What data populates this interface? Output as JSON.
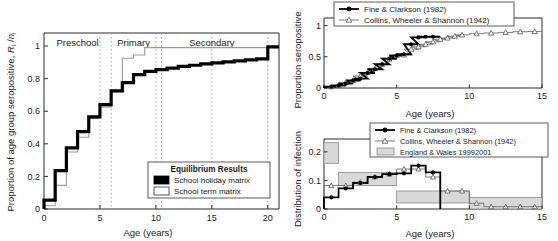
{
  "figure": {
    "panels": [
      "equilibrium-seroprofile",
      "seroprevalence-comparison",
      "infection-distribution"
    ]
  },
  "main_panel": {
    "xlabel": "Age (years)",
    "ylabel_prefix": "Proportion of age group seropositive, ",
    "ylabel_symbol": "R",
    "ylabel_sub1": "i",
    "ylabel_mid": " /",
    "ylabel_symbol2": "n",
    "ylabel_sub2": "i",
    "regions": [
      {
        "label": "Preschool",
        "x_center": 3.0
      },
      {
        "label": "Primary",
        "x_center": 8.0
      },
      {
        "label": "Secondary",
        "x_center": 15.0
      }
    ],
    "region_boundaries": [
      6,
      10.5
    ],
    "xticks": [
      "0",
      "5",
      "10",
      "15",
      "20"
    ],
    "yticks": [
      "0",
      "0.2",
      "0.4",
      "0.6",
      "0.8",
      "1"
    ],
    "legend": {
      "title": "Equilibrium Results",
      "items": [
        {
          "label": "School holiday matrix",
          "swatch": "black-filled-square"
        },
        {
          "label": "School term matrix",
          "swatch": "white-open-square"
        }
      ]
    }
  },
  "top_right_panel": {
    "xlabel": "Age (years)",
    "ylabel": "Proportion seropositive",
    "xticks": [
      "0",
      "5",
      "10",
      "15"
    ],
    "yticks": [
      "0",
      "0.5",
      "1"
    ],
    "legend": {
      "items": [
        {
          "label": "Fine & Clarkson (1982)",
          "marker": "filled-circle-line"
        },
        {
          "label": "Collins, Wheeler & Shannon (1942)",
          "marker": "open-triangle-line"
        }
      ]
    }
  },
  "bottom_right_panel": {
    "xlabel": "Age (years)",
    "ylabel": "Distribution of infection",
    "xticks": [
      "0",
      "5",
      "10",
      "15"
    ],
    "yticks": [
      "0",
      "0.1",
      "0.2"
    ],
    "legend": {
      "items": [
        {
          "label": "Fine & Clarkson (1982)",
          "marker": "filled-circle-line"
        },
        {
          "label": "Collins, Wheeler & Shannon (1942)",
          "marker": "open-triangle-line"
        },
        {
          "label": "England & Wales 19992001",
          "marker": "grey-box"
        }
      ]
    }
  },
  "chart_data": [
    {
      "type": "line",
      "id": "equilibrium-seroprofile",
      "title": "",
      "xlabel": "Age (years)",
      "ylabel": "Proportion of age group seropositive, Ri /ni",
      "xlim": [
        0,
        21
      ],
      "ylim": [
        0,
        1.08
      ],
      "grid": false,
      "legend_position": "lower-right",
      "x_edges": [
        0,
        1,
        2,
        3,
        4,
        5,
        6,
        7,
        8,
        9,
        10,
        11,
        12,
        13,
        14,
        15,
        16,
        17,
        18,
        19,
        20,
        21
      ],
      "series": [
        {
          "name": "School holiday matrix",
          "style": "thick-black-step",
          "values": [
            0.055,
            0.235,
            0.375,
            0.475,
            0.565,
            0.64,
            0.725,
            0.775,
            0.825,
            0.845,
            0.855,
            0.865,
            0.875,
            0.882,
            0.89,
            0.897,
            0.903,
            0.909,
            0.915,
            0.921,
            0.995
          ]
        },
        {
          "name": "School term matrix",
          "style": "thin-grey-step",
          "values": [
            0.02,
            0.145,
            0.35,
            0.44,
            0.555,
            0.625,
            0.72,
            0.925,
            0.945,
            0.99,
            0.99,
            0.99,
            0.99,
            0.99,
            0.99,
            0.99,
            0.99,
            0.99,
            0.99,
            0.99,
            0.995
          ]
        }
      ]
    },
    {
      "type": "line",
      "id": "seroprevalence-comparison",
      "title": "",
      "xlabel": "Age (years)",
      "ylabel": "Proportion seropositive",
      "xlim": [
        0,
        15
      ],
      "ylim": [
        0,
        1.12
      ],
      "grid": false,
      "legend_position": "upper-left",
      "series": [
        {
          "name": "Fine & Clarkson (1982)",
          "marker": "filled-circle",
          "x": [
            0.5,
            1.0,
            1.5,
            2.0,
            2.5,
            3.0,
            3.5,
            4.0,
            4.5,
            5.0,
            5.5,
            6.0,
            6.5,
            7.0,
            7.5
          ],
          "y": [
            0.02,
            0.04,
            0.07,
            0.12,
            0.15,
            0.24,
            0.3,
            0.38,
            0.47,
            0.52,
            0.54,
            0.7,
            0.81,
            0.82,
            0.82
          ]
        },
        {
          "name": "Collins, Wheeler & Shannon (1942)",
          "marker": "open-triangle",
          "x": [
            0.5,
            1.0,
            1.5,
            2.0,
            2.5,
            3.0,
            3.5,
            4.0,
            4.5,
            5.0,
            5.5,
            6.0,
            6.5,
            7.0,
            7.5,
            8.0,
            8.5,
            9.0,
            9.5,
            10.5,
            11.5,
            12.5,
            13.5,
            14.5
          ],
          "y": [
            0.02,
            0.04,
            0.09,
            0.12,
            0.19,
            0.25,
            0.31,
            0.38,
            0.46,
            0.52,
            0.53,
            0.62,
            0.66,
            0.7,
            0.74,
            0.78,
            0.8,
            0.83,
            0.85,
            0.87,
            0.88,
            0.89,
            0.9,
            0.905
          ]
        }
      ]
    },
    {
      "type": "line",
      "id": "infection-distribution",
      "title": "",
      "xlabel": "Age (years)",
      "ylabel": "Distribution of infection",
      "xlim": [
        0,
        15
      ],
      "ylim": [
        0,
        0.245
      ],
      "grid": false,
      "legend_position": "upper-right",
      "series": [
        {
          "name": "Fine & Clarkson (1982)",
          "marker": "filled-circle",
          "x": [
            0.5,
            1.5,
            2.5,
            3.5,
            4.5,
            5.5,
            6.5,
            7.5
          ],
          "y": [
            0.041,
            0.072,
            0.091,
            0.112,
            0.122,
            0.125,
            0.152,
            0.128
          ]
        },
        {
          "name": "Collins, Wheeler & Shannon (1942)",
          "marker": "open-triangle",
          "x": [
            0.5,
            1.5,
            2.5,
            3.5,
            4.5,
            5.5,
            6.5,
            7.5,
            8.5,
            9.5,
            10.5,
            11.5,
            12.5,
            13.5,
            14.5
          ],
          "y": [
            0.082,
            0.082,
            0.094,
            0.112,
            0.122,
            0.14,
            0.14,
            0.112,
            0.063,
            0.063,
            0.02,
            0.008,
            0.008,
            0.008,
            0.008
          ]
        },
        {
          "name": "England & Wales 19992001",
          "style": "grey-band",
          "bands": [
            {
              "x0": 0,
              "x1": 1,
              "lo": 0.16,
              "hi": 0.232
            },
            {
              "x0": 1,
              "x1": 5,
              "lo": 0.082,
              "hi": 0.128
            },
            {
              "x0": 5,
              "x1": 10,
              "lo": 0.021,
              "hi": 0.063
            },
            {
              "x0": 10,
              "x1": 15,
              "lo": 0.0,
              "hi": 0.04
            }
          ]
        }
      ]
    }
  ]
}
